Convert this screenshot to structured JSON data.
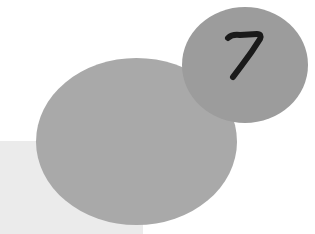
{
  "badge": {
    "number": "7"
  },
  "colors": {
    "background": "#ffffff",
    "square": "#ebebeb",
    "large_circle": "#a9a9a9",
    "small_circle": "#9c9c9c",
    "number": "#1a1a1a"
  }
}
